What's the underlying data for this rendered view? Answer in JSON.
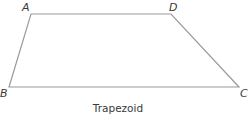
{
  "figure": {
    "caption": "Trapezoid",
    "shape": "trapezoid",
    "stroke_color": "#9a9a9a",
    "vertices": [
      {
        "label": "A",
        "x": 31,
        "y": 14
      },
      {
        "label": "D",
        "x": 171,
        "y": 14
      },
      {
        "label": "C",
        "x": 239,
        "y": 87
      },
      {
        "label": "B",
        "x": 9,
        "y": 87
      }
    ]
  }
}
